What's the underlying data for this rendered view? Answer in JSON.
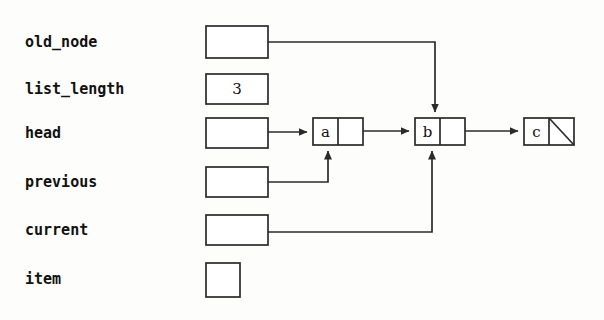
{
  "diagram": {
    "stroke_color": "#2b2b2b",
    "text_color": "#111111",
    "background_color": "#fdfdfb"
  },
  "variables": [
    {
      "name": "old_node",
      "label": "old_node",
      "value": "",
      "box": "wide",
      "points_to": "node-b"
    },
    {
      "name": "list_length",
      "label": "list_length",
      "value": "3",
      "box": "wide",
      "points_to": ""
    },
    {
      "name": "head",
      "label": "head",
      "value": "",
      "box": "wide",
      "points_to": "node-a"
    },
    {
      "name": "previous",
      "label": "previous",
      "value": "",
      "box": "wide",
      "points_to": "node-a"
    },
    {
      "name": "current",
      "label": "current",
      "value": "",
      "box": "wide",
      "points_to": "node-b"
    },
    {
      "name": "item",
      "label": "item",
      "value": "",
      "box": "square",
      "points_to": ""
    }
  ],
  "nodes": [
    {
      "id": "node-a",
      "value": "a",
      "next": "node-b",
      "null_next": false
    },
    {
      "id": "node-b",
      "value": "b",
      "next": "node-c",
      "null_next": false
    },
    {
      "id": "node-c",
      "value": "c",
      "next": "",
      "null_next": true
    }
  ],
  "pointers": [
    {
      "from": "old_node",
      "to": "node-b",
      "enters": "top"
    },
    {
      "from": "head",
      "to": "node-a",
      "enters": "left"
    },
    {
      "from": "previous",
      "to": "node-a",
      "enters": "bottom"
    },
    {
      "from": "current",
      "to": "node-b",
      "enters": "bottom"
    },
    {
      "from": "node-a",
      "to": "node-b",
      "enters": "left"
    },
    {
      "from": "node-b",
      "to": "node-c",
      "enters": "left"
    }
  ]
}
